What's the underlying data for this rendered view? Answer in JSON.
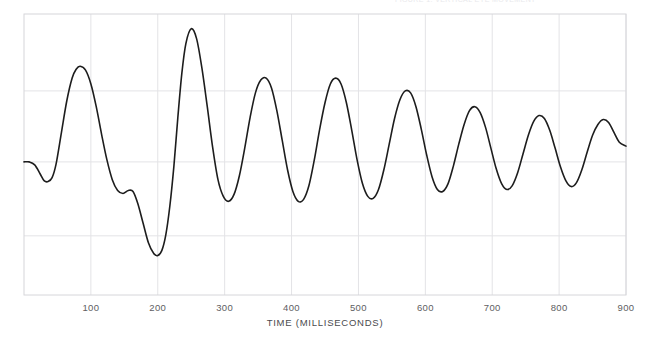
{
  "header": {
    "clipped_text": "FIGURE 1.  VERTICAL EYE MOVEMENT"
  },
  "chart_data": {
    "type": "line",
    "title": "",
    "xlabel": "TIME (MILLISECONDS)",
    "ylabel": "",
    "xlim": [
      0,
      900
    ],
    "ylim": [
      -1.35,
      1.5
    ],
    "grid": true,
    "legend": null,
    "xticks": [
      100,
      200,
      300,
      400,
      500,
      600,
      700,
      800,
      900
    ],
    "xtick_labels": [
      "100",
      "200",
      "300",
      "400",
      "500",
      "600",
      "700",
      "800",
      "900"
    ],
    "yticks": [
      -0.75,
      0.0,
      0.72
    ],
    "ytick_labels": [
      "",
      "",
      ""
    ],
    "line_color": "#1d1d1d",
    "line_width": 1.6,
    "grid_color": "#e3e3e6",
    "frame_color": "#d6d6da",
    "series": [
      {
        "name": "damped oscillation",
        "x": [
          0,
          8,
          16,
          24,
          30,
          36,
          42,
          48,
          56,
          64,
          72,
          78,
          84,
          92,
          100,
          108,
          116,
          124,
          132,
          140,
          148,
          156,
          163,
          170,
          178,
          186,
          194,
          200,
          206,
          212,
          218,
          224,
          230,
          236,
          242,
          250,
          258,
          266,
          274,
          282,
          290,
          298,
          306,
          314,
          322,
          330,
          338,
          346,
          354,
          362,
          370,
          378,
          386,
          394,
          402,
          410,
          418,
          426,
          434,
          442,
          450,
          458,
          466,
          474,
          482,
          490,
          498,
          506,
          514,
          522,
          530,
          538,
          546,
          554,
          562,
          570,
          578,
          586,
          594,
          602,
          610,
          618,
          626,
          634,
          642,
          650,
          658,
          666,
          674,
          682,
          690,
          698,
          706,
          714,
          722,
          730,
          738,
          746,
          754,
          762,
          770,
          778,
          786,
          794,
          802,
          810,
          818,
          826,
          834,
          842,
          850,
          858,
          866,
          874,
          882,
          890,
          900
        ],
        "y": [
          0.0,
          0.0,
          -0.03,
          -0.12,
          -0.19,
          -0.2,
          -0.16,
          -0.02,
          0.3,
          0.62,
          0.85,
          0.94,
          0.97,
          0.93,
          0.79,
          0.56,
          0.28,
          0.02,
          -0.18,
          -0.29,
          -0.32,
          -0.29,
          -0.3,
          -0.42,
          -0.62,
          -0.82,
          -0.93,
          -0.95,
          -0.9,
          -0.74,
          -0.45,
          -0.05,
          0.45,
          0.9,
          1.2,
          1.35,
          1.25,
          0.95,
          0.56,
          0.15,
          -0.18,
          -0.35,
          -0.4,
          -0.33,
          -0.14,
          0.14,
          0.45,
          0.7,
          0.83,
          0.85,
          0.75,
          0.52,
          0.22,
          -0.08,
          -0.3,
          -0.4,
          -0.38,
          -0.24,
          0.02,
          0.33,
          0.6,
          0.79,
          0.85,
          0.79,
          0.6,
          0.32,
          0.02,
          -0.22,
          -0.35,
          -0.37,
          -0.28,
          -0.08,
          0.18,
          0.44,
          0.63,
          0.72,
          0.7,
          0.56,
          0.33,
          0.07,
          -0.15,
          -0.28,
          -0.3,
          -0.22,
          -0.04,
          0.18,
          0.38,
          0.52,
          0.56,
          0.5,
          0.35,
          0.14,
          -0.07,
          -0.22,
          -0.28,
          -0.24,
          -0.11,
          0.08,
          0.27,
          0.41,
          0.47,
          0.44,
          0.32,
          0.14,
          -0.05,
          -0.19,
          -0.25,
          -0.21,
          -0.08,
          0.1,
          0.27,
          0.38,
          0.43,
          0.4,
          0.3,
          0.2,
          0.16
        ]
      }
    ]
  }
}
